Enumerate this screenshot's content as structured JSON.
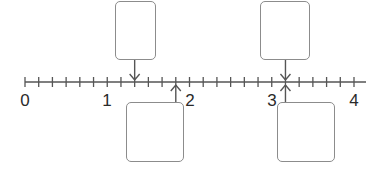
{
  "diagram": {
    "type": "number-line",
    "range": [
      0,
      4
    ],
    "subdivisions_per_unit": 6,
    "labels": [
      {
        "value": 0,
        "text": "0"
      },
      {
        "value": 1,
        "text": "1"
      },
      {
        "value": 2,
        "text": "2"
      },
      {
        "value": 3,
        "text": "3"
      },
      {
        "value": 4,
        "text": "4"
      }
    ],
    "pointers": [
      {
        "id": "top-left",
        "position": "above",
        "direction": "down",
        "value_fraction": "1 2/6",
        "value": 1.3333,
        "box_text": ""
      },
      {
        "id": "bottom-left",
        "position": "below",
        "direction": "up",
        "value_fraction": "1 5/6",
        "value": 1.8333,
        "box_text": ""
      },
      {
        "id": "top-right",
        "position": "above",
        "direction": "down",
        "value_fraction": "3 1/6",
        "value": 3.1667,
        "box_text": ""
      },
      {
        "id": "bottom-right",
        "position": "below",
        "direction": "up",
        "value_fraction": "3 1/6",
        "value": 3.1667,
        "box_text": ""
      }
    ],
    "colors": {
      "axis": "#555555",
      "box_border": "#8c8c8c",
      "label": "#2a2a2a",
      "arrow": "#555555"
    }
  }
}
